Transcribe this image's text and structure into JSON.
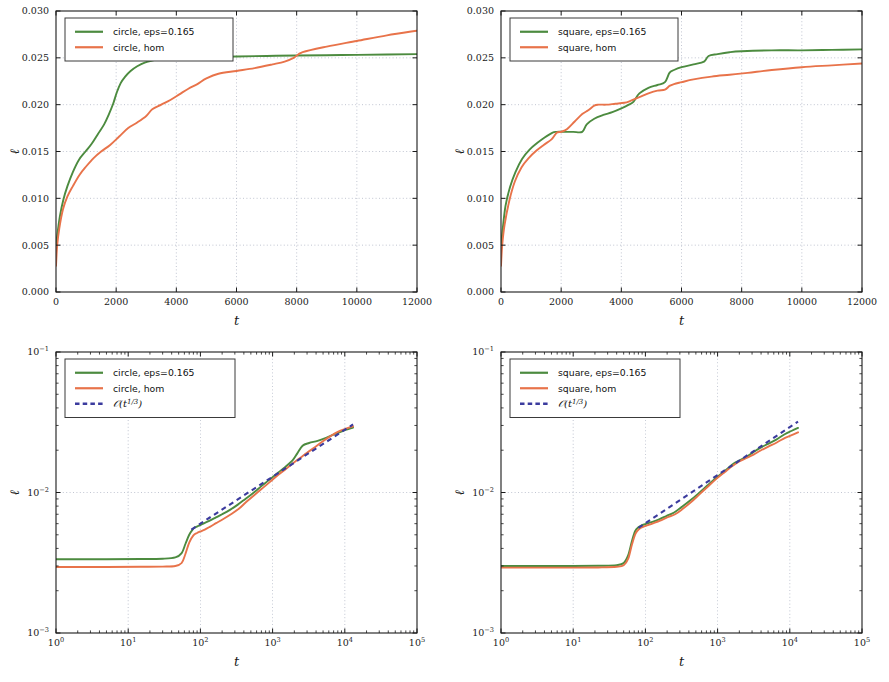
{
  "figure": {
    "panel_count": 4,
    "colors": {
      "green": "#4c8b3f",
      "orange": "#e8734a",
      "blue_dashed": "#3b3b9e",
      "grid": "#9aa0b4",
      "axis": "#1a1a1a"
    }
  },
  "chart_data": [
    {
      "id": "top-left",
      "type": "line",
      "title": "",
      "xlabel": "t",
      "ylabel": "ℓ",
      "xscale": "linear",
      "yscale": "linear",
      "xlim": [
        0,
        12000
      ],
      "ylim": [
        0.0,
        0.03
      ],
      "xticks": [
        0,
        2000,
        4000,
        6000,
        8000,
        10000,
        12000
      ],
      "xticklabels": [
        "0",
        "2000",
        "4000",
        "6000",
        "8000",
        "10000",
        "12000"
      ],
      "yticks": [
        0.0,
        0.005,
        0.01,
        0.015,
        0.02,
        0.025,
        0.03
      ],
      "yticklabels": [
        "0.000",
        "0.005",
        "0.010",
        "0.015",
        "0.020",
        "0.025",
        "0.030"
      ],
      "grid": true,
      "legend_position": "upper left",
      "series": [
        {
          "name": "circle, eps=0.165",
          "color": "#4c8b3f",
          "style": "solid",
          "x": [
            0,
            60,
            130,
            240,
            380,
            560,
            760,
            980,
            1180,
            1400,
            1600,
            1760,
            1900,
            2020,
            2150,
            2300,
            2480,
            2700,
            2950,
            3200,
            3500,
            3900,
            4400,
            5000,
            6000,
            7000,
            8000,
            9500,
            11000,
            12000
          ],
          "y": [
            0.005,
            0.0065,
            0.0081,
            0.0098,
            0.0113,
            0.0128,
            0.0141,
            0.015,
            0.0158,
            0.0169,
            0.0179,
            0.019,
            0.0201,
            0.0213,
            0.0223,
            0.023,
            0.0236,
            0.0241,
            0.0245,
            0.0247,
            0.0249,
            0.025,
            0.02505,
            0.0251,
            0.02515,
            0.0252,
            0.02525,
            0.0253,
            0.02535,
            0.0254
          ]
        },
        {
          "name": "circle, hom",
          "color": "#e8734a",
          "style": "solid",
          "x": [
            0,
            40,
            110,
            230,
            380,
            560,
            780,
            1000,
            1250,
            1500,
            1800,
            2100,
            2400,
            2700,
            3000,
            3200,
            3500,
            3800,
            4100,
            4400,
            4700,
            5000,
            5400,
            6000,
            6600,
            7200,
            7600,
            7900,
            8200,
            9000,
            10000,
            11000,
            12000
          ],
          "y": [
            0.0028,
            0.005,
            0.0068,
            0.0088,
            0.0102,
            0.0113,
            0.0125,
            0.0134,
            0.0143,
            0.015,
            0.0157,
            0.0166,
            0.0175,
            0.0181,
            0.0188,
            0.0195,
            0.02,
            0.0205,
            0.0211,
            0.0217,
            0.0222,
            0.0228,
            0.0233,
            0.0236,
            0.0239,
            0.0243,
            0.0246,
            0.025,
            0.0256,
            0.0262,
            0.0268,
            0.0274,
            0.0279
          ]
        }
      ]
    },
    {
      "id": "top-right",
      "type": "line",
      "title": "",
      "xlabel": "t",
      "ylabel": "ℓ",
      "xscale": "linear",
      "yscale": "linear",
      "xlim": [
        0,
        12000
      ],
      "ylim": [
        0.0,
        0.03
      ],
      "xticks": [
        0,
        2000,
        4000,
        6000,
        8000,
        10000,
        12000
      ],
      "xticklabels": [
        "0",
        "2000",
        "4000",
        "6000",
        "8000",
        "10000",
        "12000"
      ],
      "yticks": [
        0.0,
        0.005,
        0.01,
        0.015,
        0.02,
        0.025,
        0.03
      ],
      "yticklabels": [
        "0.000",
        "0.005",
        "0.010",
        "0.015",
        "0.020",
        "0.025",
        "0.030"
      ],
      "grid": true,
      "legend_position": "upper left",
      "series": [
        {
          "name": "square, eps=0.165",
          "color": "#4c8b3f",
          "style": "solid",
          "x": [
            0,
            60,
            150,
            300,
            480,
            700,
            950,
            1200,
            1450,
            1700,
            1850,
            2100,
            2400,
            2700,
            2850,
            3100,
            3400,
            3700,
            4000,
            4250,
            4400,
            4600,
            4900,
            5200,
            5450,
            5600,
            5750,
            6000,
            6400,
            6750,
            6900,
            7200,
            7600,
            8000,
            9000,
            10000,
            11000,
            12000
          ],
          "y": [
            0.005,
            0.0068,
            0.0092,
            0.0112,
            0.0128,
            0.0142,
            0.0152,
            0.0159,
            0.0165,
            0.017,
            0.0171,
            0.0171,
            0.0171,
            0.0171,
            0.0179,
            0.0185,
            0.0189,
            0.0192,
            0.0196,
            0.02,
            0.0203,
            0.0212,
            0.0218,
            0.0221,
            0.0224,
            0.0234,
            0.0237,
            0.024,
            0.0243,
            0.0246,
            0.0252,
            0.0254,
            0.0256,
            0.0257,
            0.0258,
            0.0258,
            0.02585,
            0.0259
          ]
        },
        {
          "name": "square, hom",
          "color": "#e8734a",
          "style": "solid",
          "x": [
            0,
            40,
            120,
            280,
            460,
            680,
            920,
            1180,
            1420,
            1680,
            1850,
            2000,
            2200,
            2450,
            2700,
            2900,
            3100,
            3250,
            3500,
            3800,
            4100,
            4300,
            4600,
            4900,
            5200,
            5450,
            5600,
            5750,
            6000,
            6400,
            7000,
            7600,
            8200,
            9000,
            10000,
            11000,
            12000
          ],
          "y": [
            0.0028,
            0.005,
            0.0072,
            0.0098,
            0.0118,
            0.0133,
            0.0143,
            0.0151,
            0.0157,
            0.0163,
            0.017,
            0.0171,
            0.0174,
            0.0182,
            0.019,
            0.0194,
            0.0199,
            0.02,
            0.02,
            0.0201,
            0.0202,
            0.0204,
            0.0208,
            0.0212,
            0.0215,
            0.0216,
            0.022,
            0.0222,
            0.0224,
            0.0227,
            0.023,
            0.0232,
            0.0234,
            0.0237,
            0.024,
            0.0242,
            0.0244
          ]
        }
      ]
    },
    {
      "id": "bottom-left",
      "type": "line",
      "title": "",
      "xlabel": "t",
      "ylabel": "ℓ",
      "xscale": "log",
      "yscale": "log",
      "xlim": [
        1,
        100000
      ],
      "ylim": [
        0.001,
        0.1
      ],
      "xticks": [
        1,
        10,
        100,
        1000,
        10000,
        100000
      ],
      "xticklabels": [
        "10^0",
        "10^1",
        "10^2",
        "10^3",
        "10^4",
        "10^5"
      ],
      "yticks": [
        0.001,
        0.01,
        0.1
      ],
      "yticklabels": [
        "10^-3",
        "10^-2",
        "10^-1"
      ],
      "grid": true,
      "legend_position": "upper left",
      "series": [
        {
          "name": "circle, eps=0.165",
          "color": "#4c8b3f",
          "style": "solid",
          "x": [
            1,
            5,
            15,
            30,
            45,
            55,
            62,
            70,
            78,
            85,
            95,
            110,
            130,
            160,
            200,
            260,
            330,
            420,
            550,
            700,
            900,
            1200,
            1500,
            1900,
            2200,
            2600,
            3200,
            4200,
            5500,
            7500,
            10000,
            13000
          ],
          "y": [
            0.00335,
            0.00335,
            0.00336,
            0.00338,
            0.00345,
            0.0037,
            0.0043,
            0.005,
            0.00545,
            0.00565,
            0.0058,
            0.006,
            0.00625,
            0.0066,
            0.007,
            0.00755,
            0.0082,
            0.009,
            0.01,
            0.0111,
            0.0123,
            0.0139,
            0.0152,
            0.017,
            0.019,
            0.0215,
            0.0225,
            0.0233,
            0.0245,
            0.0262,
            0.0278,
            0.029
          ]
        },
        {
          "name": "circle, hom",
          "color": "#e8734a",
          "style": "solid",
          "x": [
            1,
            5,
            15,
            30,
            45,
            55,
            62,
            70,
            80,
            90,
            100,
            115,
            135,
            165,
            205,
            265,
            340,
            430,
            560,
            720,
            920,
            1200,
            1500,
            1900,
            2400,
            3000,
            3800,
            4800,
            6200,
            8000,
            10000,
            13000
          ],
          "y": [
            0.00295,
            0.00295,
            0.00296,
            0.00297,
            0.003,
            0.00315,
            0.00365,
            0.0044,
            0.00495,
            0.00515,
            0.00528,
            0.00545,
            0.0057,
            0.00605,
            0.00645,
            0.007,
            0.00765,
            0.00855,
            0.0096,
            0.0107,
            0.0119,
            0.0134,
            0.0146,
            0.0161,
            0.0176,
            0.0192,
            0.0209,
            0.0229,
            0.025,
            0.027,
            0.0283,
            0.0296
          ]
        },
        {
          "name": "O(t^(1/3))",
          "color": "#3b3b9e",
          "style": "dashed",
          "x": [
            75,
            13000
          ],
          "y": [
            0.00545,
            0.0305
          ],
          "slope": 0.3333
        }
      ]
    },
    {
      "id": "bottom-right",
      "type": "line",
      "title": "",
      "xlabel": "t",
      "ylabel": "ℓ",
      "xscale": "log",
      "yscale": "log",
      "xlim": [
        1,
        100000
      ],
      "ylim": [
        0.001,
        0.1
      ],
      "xticks": [
        1,
        10,
        100,
        1000,
        10000,
        100000
      ],
      "xticklabels": [
        "10^0",
        "10^1",
        "10^2",
        "10^3",
        "10^4",
        "10^5"
      ],
      "yticks": [
        0.001,
        0.01,
        0.1
      ],
      "yticklabels": [
        "10^-3",
        "10^-2",
        "10^-1"
      ],
      "grid": true,
      "legend_position": "upper left",
      "series": [
        {
          "name": "square, eps=0.165",
          "color": "#4c8b3f",
          "style": "solid",
          "x": [
            1,
            10,
            25,
            40,
            50,
            58,
            65,
            72,
            80,
            90,
            105,
            125,
            155,
            195,
            250,
            320,
            420,
            550,
            720,
            950,
            1250,
            1600,
            2000,
            2500,
            3100,
            3900,
            5000,
            6500,
            8500,
            10500,
            13000
          ],
          "y": [
            0.003,
            0.003,
            0.00301,
            0.00304,
            0.00315,
            0.0036,
            0.0045,
            0.0053,
            0.00565,
            0.00585,
            0.006,
            0.00618,
            0.00645,
            0.0068,
            0.0072,
            0.0079,
            0.0088,
            0.0099,
            0.0112,
            0.0127,
            0.0142,
            0.0158,
            0.0169,
            0.0179,
            0.0193,
            0.0208,
            0.0222,
            0.0238,
            0.026,
            0.0274,
            0.0288
          ]
        },
        {
          "name": "square, hom",
          "color": "#e8734a",
          "style": "solid",
          "x": [
            1,
            10,
            25,
            40,
            50,
            58,
            65,
            73,
            82,
            93,
            108,
            130,
            160,
            200,
            258,
            330,
            430,
            560,
            730,
            960,
            1260,
            1620,
            2020,
            2520,
            3150,
            3950,
            5050,
            6600,
            8600,
            10600,
            13000
          ],
          "y": [
            0.00292,
            0.00292,
            0.00293,
            0.00296,
            0.00304,
            0.0034,
            0.00425,
            0.0051,
            0.0055,
            0.0057,
            0.00585,
            0.00605,
            0.0063,
            0.00665,
            0.007,
            0.00765,
            0.00855,
            0.0097,
            0.011,
            0.0125,
            0.014,
            0.0155,
            0.0167,
            0.0176,
            0.0186,
            0.0199,
            0.0212,
            0.0227,
            0.0245,
            0.0256,
            0.0268
          ]
        },
        {
          "name": "O(t^(1/3))",
          "color": "#3b3b9e",
          "style": "dashed",
          "x": [
            80,
            13000
          ],
          "y": [
            0.0056,
            0.032
          ],
          "slope": 0.3333
        }
      ]
    }
  ],
  "panels": {
    "top_left": {
      "legend": [
        {
          "label": "circle, eps=0.165",
          "color": "#4c8b3f",
          "style": "solid"
        },
        {
          "label": "circle, hom",
          "color": "#e8734a",
          "style": "solid"
        }
      ],
      "xlabel": "t",
      "ylabel": "ℓ",
      "xticklabels": [
        "0",
        "2000",
        "4000",
        "6000",
        "8000",
        "10000",
        "12000"
      ],
      "yticklabels": [
        "0.000",
        "0.005",
        "0.010",
        "0.015",
        "0.020",
        "0.025",
        "0.030"
      ]
    },
    "top_right": {
      "legend": [
        {
          "label": "square, eps=0.165",
          "color": "#4c8b3f",
          "style": "solid"
        },
        {
          "label": "square, hom",
          "color": "#e8734a",
          "style": "solid"
        }
      ],
      "xlabel": "t",
      "ylabel": "ℓ",
      "xticklabels": [
        "0",
        "2000",
        "4000",
        "6000",
        "8000",
        "10000",
        "12000"
      ],
      "yticklabels": [
        "0.000",
        "0.005",
        "0.010",
        "0.015",
        "0.020",
        "0.025",
        "0.030"
      ]
    },
    "bottom_left": {
      "legend": [
        {
          "label": "circle, eps=0.165",
          "color": "#4c8b3f",
          "style": "solid"
        },
        {
          "label": "circle, hom",
          "color": "#e8734a",
          "style": "solid"
        },
        {
          "label": "O(t^(1/3))",
          "color": "#3b3b9e",
          "style": "dashed"
        }
      ],
      "xlabel": "t",
      "ylabel": "ℓ",
      "xticklabels": [
        "10^0",
        "10^1",
        "10^2",
        "10^3",
        "10^4",
        "10^5"
      ],
      "yticklabels": [
        "10^-3",
        "10^-2",
        "10^-1"
      ]
    },
    "bottom_right": {
      "legend": [
        {
          "label": "square, eps=0.165",
          "color": "#4c8b3f",
          "style": "solid"
        },
        {
          "label": "square, hom",
          "color": "#e8734a",
          "style": "solid"
        },
        {
          "label": "O(t^(1/3))",
          "color": "#3b3b9e",
          "style": "dashed"
        }
      ],
      "xlabel": "t",
      "ylabel": "ℓ",
      "xticklabels": [
        "10^0",
        "10^1",
        "10^2",
        "10^3",
        "10^4",
        "10^5"
      ],
      "yticklabels": [
        "10^-3",
        "10^-2",
        "10^-1"
      ]
    }
  }
}
